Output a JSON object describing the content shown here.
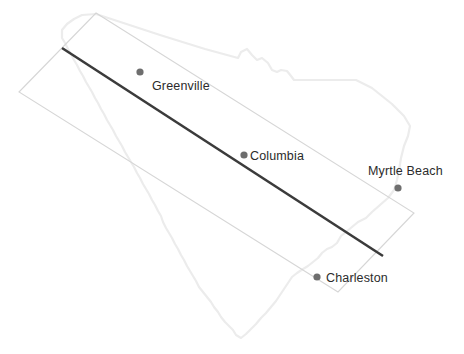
{
  "canvas": {
    "width": 464,
    "height": 354,
    "background": "#ffffff"
  },
  "map": {
    "region_name": "South Carolina",
    "state_outline_color": "#ececec",
    "bounding_box_color": "#d6d6d6",
    "transect_line_color": "#3b3b3b",
    "dot_color": "#6e6e6e",
    "label_color": "#2b2b2b"
  },
  "bounding_box": {
    "name": "rotated-bounding-box",
    "points": "96,13 414,213 338,292 19,92"
  },
  "transect": {
    "name": "diagonal-transect",
    "x1": 62,
    "y1": 48,
    "x2": 383,
    "y2": 256
  },
  "state_path": "M 96 14 L 160 35 L 205 49 L 238 58 L 241 52 L 247 49 L 252 55 L 257 60 L 262 58 L 268 63 L 272 70 L 277 72 L 281 70 L 287 71 L 291 76 L 294 80 L 310 80 L 338 80 L 356 80 L 372 88 L 392 104 L 404 116 L 410 126 L 408 136 L 404 146 L 401 158 L 399 170 L 397 180 L 394 190 L 388 198 L 380 205 L 372 212 L 366 218 L 358 222 L 352 227 L 346 232 L 341 236 L 337 243 L 332 247 L 327 249 L 322 253 L 318 258 L 313 262 L 308 266 L 303 269 L 297 273 L 292 277 L 288 283 L 284 289 L 280 295 L 276 301 L 271 307 L 266 313 L 261 318 L 256 324 L 251 329 L 246 334 L 241 338 L 236 335 L 233 330 L 229 326 L 225 322 L 221 317 L 218 312 L 214 307 L 211 302 L 207 297 L 203 292 L 199 287 L 196 281 L 193 276 L 190 271 L 187 266 L 184 260 L 181 255 L 178 249 L 175 244 L 172 238 L 169 233 L 166 228 L 163 222 L 161 216 L 158 211 L 155 205 L 152 200 L 149 194 L 146 189 L 143 184 L 140 178 L 137 173 L 134 167 L 131 162 L 128 157 L 125 152 L 122 146 L 119 141 L 116 136 L 113 130 L 110 125 L 107 120 L 104 114 L 101 109 L 98 103 L 95 98 L 92 92 L 89 87 L 86 82 L 83 76 L 80 71 L 77 65 L 74 60 L 71 54 L 68 49 L 65 43 L 62 38 L 62 30 L 67 24 L 74 19 L 82 15 Z",
  "cities": [
    {
      "name": "Greenville",
      "label": "Greenville",
      "dot_x": 140,
      "dot_y": 72,
      "dot_r": 3.6,
      "label_x": 152,
      "label_y": 90,
      "label_anchor": "start"
    },
    {
      "name": "Columbia",
      "label": "Columbia",
      "dot_x": 244,
      "dot_y": 155,
      "dot_r": 3.6,
      "label_x": 250,
      "label_y": 160,
      "label_anchor": "start"
    },
    {
      "name": "Myrtle Beach",
      "label": "Myrtle Beach",
      "dot_x": 398,
      "dot_y": 188,
      "dot_r": 3.6,
      "label_x": 368,
      "label_y": 175,
      "label_anchor": "start"
    },
    {
      "name": "Charleston",
      "label": "Charleston",
      "dot_x": 317,
      "dot_y": 277,
      "dot_r": 3.6,
      "label_x": 326,
      "label_y": 282,
      "label_anchor": "start"
    }
  ]
}
